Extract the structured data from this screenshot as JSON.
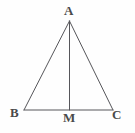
{
  "figure": {
    "kind": "geometry-diagram",
    "background_color": "#fefefe",
    "stroke_color": "#56565a",
    "label_color": "#4a4a4a",
    "stroke_width": 1,
    "width": 135,
    "height": 133,
    "points": {
      "A": {
        "label": "A",
        "x": 69.5,
        "y": 21
      },
      "B": {
        "label": "B",
        "x": 24,
        "y": 110
      },
      "C": {
        "label": "C",
        "x": 113,
        "y": 110
      },
      "M": {
        "label": "M",
        "x": 69.5,
        "y": 110
      }
    },
    "segments": [
      {
        "name": "AB",
        "from": "A",
        "to": "B"
      },
      {
        "name": "AC",
        "from": "A",
        "to": "C"
      },
      {
        "name": "BC",
        "from": "B",
        "to": "C"
      },
      {
        "name": "AM",
        "from": "A",
        "to": "M"
      }
    ]
  }
}
